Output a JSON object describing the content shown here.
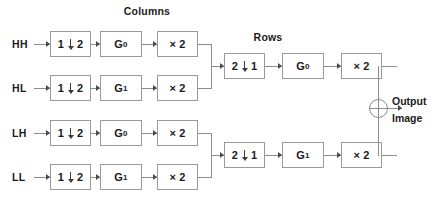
{
  "diagram": {
    "title_hidden": "",
    "headers": [
      {
        "id": "columns",
        "label": "Columns"
      },
      {
        "id": "rows",
        "label": "Rows"
      }
    ],
    "inputs": [
      {
        "id": "hh",
        "label": "HH"
      },
      {
        "id": "hl",
        "label": "HL"
      },
      {
        "id": "lh",
        "label": "LH"
      },
      {
        "id": "ll",
        "label": "LL"
      }
    ],
    "column_stage": {
      "upsampler_label": "1",
      "upsampler_label_2": "2",
      "rows": [
        {
          "input": "HH",
          "filter": "G",
          "filter_sub": "0",
          "gain": "× 2"
        },
        {
          "input": "HL",
          "filter": "G",
          "filter_sub": "1",
          "gain": "× 2"
        },
        {
          "input": "LH",
          "filter": "G",
          "filter_sub": "0",
          "gain": "× 2"
        },
        {
          "input": "LL",
          "filter": "G",
          "filter_sub": "1",
          "gain": "× 2"
        }
      ]
    },
    "row_stage": {
      "upsampler_label": "2",
      "upsampler_label_2": "1",
      "branches": [
        {
          "filter": "G",
          "filter_sub": "0",
          "gain": "× 2"
        },
        {
          "filter": "G",
          "filter_sub": "1",
          "gain": "× 2"
        }
      ]
    },
    "output": {
      "line1": "Output",
      "line2": "Image",
      "adder_symbol": "+"
    },
    "colors": {
      "box_border": "#9a9a9a",
      "wire": "#8d8d8d",
      "text": "#1a1a1a",
      "background": "#ffffff"
    }
  }
}
